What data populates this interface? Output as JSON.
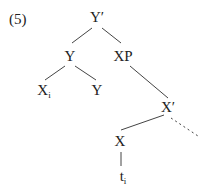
{
  "example_number": "(5)",
  "tree": {
    "root": {
      "label": "Y′"
    },
    "y_node": {
      "label": "Y"
    },
    "xp_node": {
      "label": "XP"
    },
    "xi_node": {
      "label": "X",
      "subscript": "i"
    },
    "y_leaf": {
      "label": "Y"
    },
    "xbar_node": {
      "label": "X′"
    },
    "x_node": {
      "label": "X"
    },
    "trace": {
      "label": "t",
      "subscript": "i"
    }
  },
  "colors": {
    "line": "#444444",
    "text": "#222222"
  }
}
